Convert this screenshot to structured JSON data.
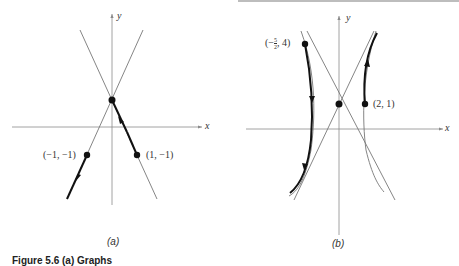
{
  "figure": {
    "caption": "Figure 5.6  (a) Graphs",
    "panels": [
      {
        "id": "a",
        "label": "(a)",
        "x_axis_label": "x",
        "y_axis_label": "y",
        "points": [
          {
            "label": "(−1, −1)",
            "x": -1,
            "y": -1
          },
          {
            "label": "(1, −1)",
            "x": 1,
            "y": -1
          }
        ],
        "equilibrium": "origin crossing of asymptote lines",
        "trajectories": [
          {
            "through": "(−1, −1)",
            "direction": "downward, away from intersection"
          },
          {
            "through": "(1, −1)",
            "direction": "upward, toward intersection"
          }
        ]
      },
      {
        "id": "b",
        "label": "(b)",
        "x_axis_label": "x",
        "y_axis_label": "y",
        "points": [
          {
            "label_prefix": "(−",
            "frac_num": "5",
            "frac_den": "2",
            "label_suffix": ", 4)",
            "x": -2.5,
            "y": 4
          },
          {
            "label": "(2, 1)",
            "x": 2,
            "y": 1
          }
        ],
        "trajectories": [
          {
            "through": "(−5/2, 4)",
            "direction": "downward"
          },
          {
            "through": "(2, 1)",
            "direction": "upward"
          }
        ]
      }
    ]
  },
  "colors": {
    "thin_line": "#777777",
    "bold_line": "#111111",
    "axis": "#8a8a8a",
    "text": "#333333"
  }
}
